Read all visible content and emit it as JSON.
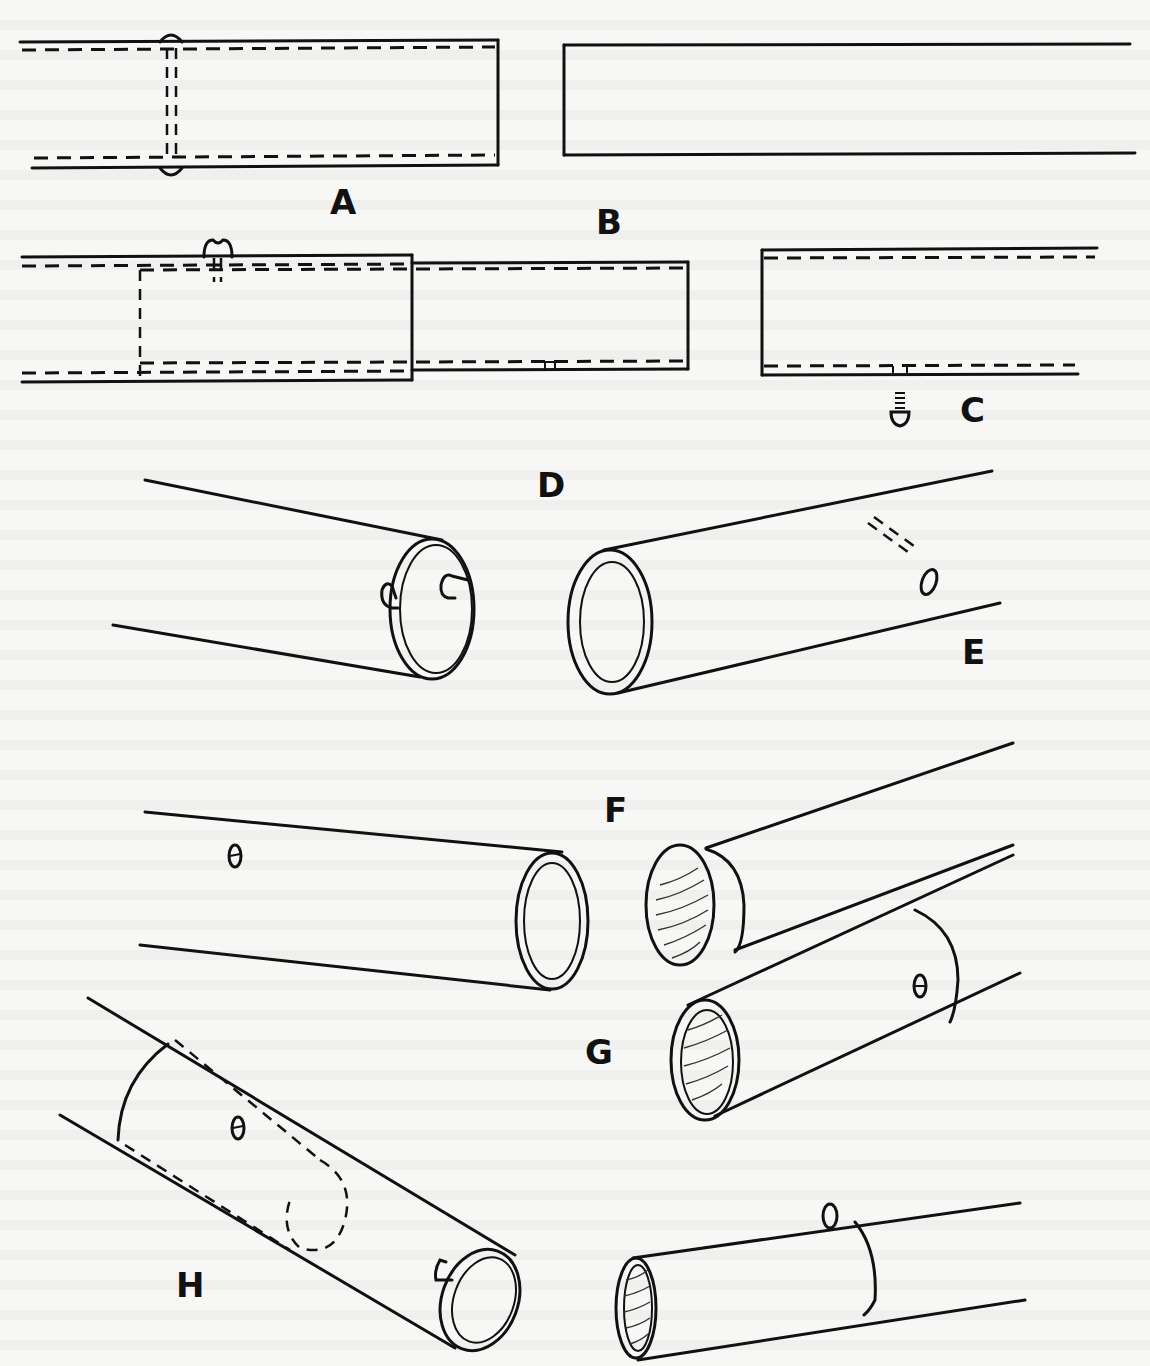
{
  "figure": {
    "labels": {
      "a": "A",
      "b": "B",
      "c": "C",
      "d": "D",
      "e": "E",
      "f": "F",
      "g": "G",
      "h": "H"
    },
    "colors": {
      "ink": "#111111",
      "paper": "#f7f7f5"
    }
  }
}
